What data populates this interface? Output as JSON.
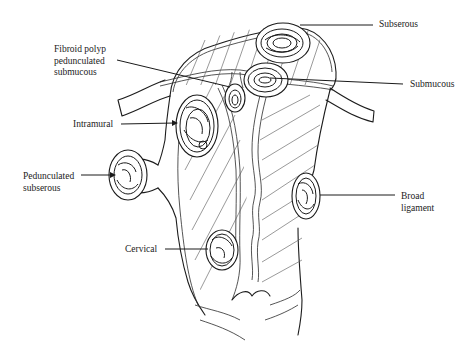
{
  "diagram": {
    "labels": {
      "subserous": "Subserous",
      "fibroid_polyp": "Fibroid polyp\npedunculated\nsubmucous",
      "submucous": "Submucous",
      "intramural": "Intramural",
      "pedunculated_subserous": "Pedunculated\nsubserous",
      "broad_ligament": "Broad\nligament",
      "cervical": "Cervical"
    },
    "colors": {
      "ink": "#1c1c1c",
      "background": "#ffffff"
    }
  }
}
